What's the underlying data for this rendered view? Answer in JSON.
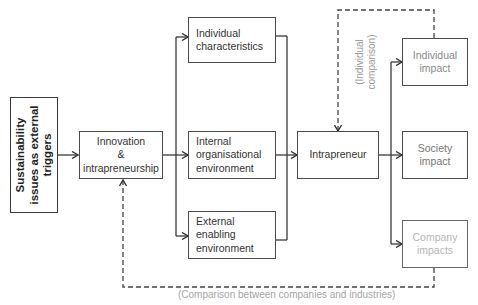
{
  "diagram": {
    "trigger": {
      "lines": [
        "Sustainability",
        "issues as external",
        "triggers"
      ]
    },
    "innovation": {
      "lines": [
        "Innovation",
        "&",
        "intrapreneurship"
      ]
    },
    "factors": [
      {
        "lines": [
          "Individual",
          "characteristics"
        ]
      },
      {
        "lines": [
          "Internal",
          "organisational",
          "environment"
        ]
      },
      {
        "lines": [
          "External enabling",
          "environment"
        ]
      }
    ],
    "intrapreneur": {
      "label": "Intrapreneur"
    },
    "impacts": [
      {
        "lines": [
          "Individual",
          "impact"
        ]
      },
      {
        "lines": [
          "Society",
          "impact"
        ]
      },
      {
        "lines": [
          "Company",
          "impacts"
        ]
      }
    ],
    "feedback_labels": {
      "individual_comparison": [
        "(Individual",
        "comparison)"
      ],
      "company_comparison": "(Comparison between companies and industries)"
    },
    "colors": {
      "line": "#3a3a3a",
      "dashed": "#444444",
      "faint_text": "#999999"
    }
  }
}
